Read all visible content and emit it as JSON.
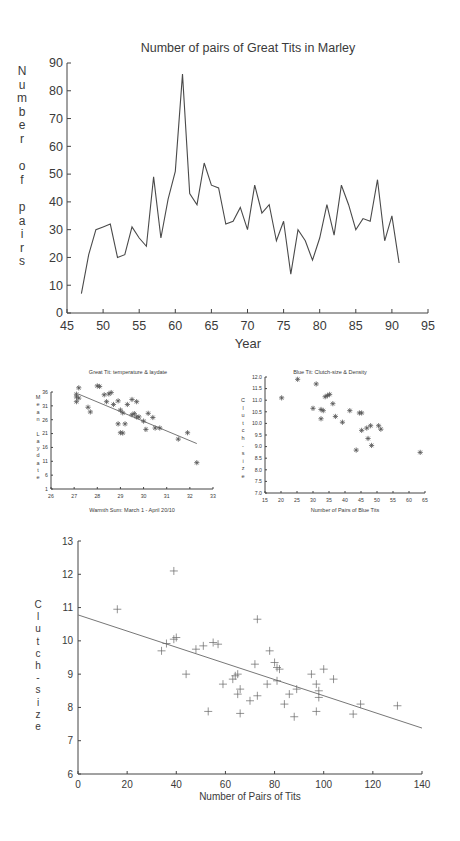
{
  "chart_data": [
    {
      "id": "great-tit-pairs",
      "type": "line",
      "title": "Number of pairs of Great Tits in Marley",
      "xlabel": "Year",
      "ylabel": "Number of pairs",
      "xlim": [
        45,
        95
      ],
      "ylim": [
        0,
        90
      ],
      "xticks": [
        45,
        50,
        55,
        60,
        65,
        70,
        75,
        80,
        85,
        90,
        95
      ],
      "yticks": [
        0,
        10,
        20,
        30,
        40,
        50,
        60,
        70,
        80,
        90
      ],
      "grid": false,
      "x": [
        47,
        48,
        49,
        50,
        51,
        52,
        53,
        54,
        55,
        56,
        57,
        58,
        59,
        60,
        61,
        62,
        63,
        64,
        65,
        66,
        67,
        68,
        69,
        70,
        71,
        72,
        73,
        74,
        75,
        76,
        77,
        78,
        79,
        80,
        81,
        82,
        83,
        84,
        85,
        86,
        87,
        88,
        89,
        90,
        91
      ],
      "y": [
        7,
        21,
        30,
        31,
        32,
        20,
        21,
        31,
        27,
        24,
        49,
        27,
        41,
        51,
        86,
        43,
        39,
        54,
        46,
        45,
        32,
        33,
        38,
        30,
        46,
        36,
        39,
        26,
        33,
        14,
        30,
        26,
        19,
        27,
        39,
        28,
        46,
        39,
        30,
        34,
        33,
        48,
        26,
        35,
        18
      ]
    },
    {
      "id": "great-tit-temperature-laydate",
      "type": "scatter",
      "title": "Great Tit: temperature & laydate",
      "xlabel": "Warmth Sum: March 1 - April 20/10",
      "ylabel": "Mean Laydate",
      "xlim": [
        26,
        33
      ],
      "ylim": [
        1,
        36
      ],
      "xticks": [
        26,
        27,
        28,
        29,
        30,
        31,
        32,
        33
      ],
      "yticks": [
        1,
        6,
        11,
        16,
        21,
        26,
        31,
        36
      ],
      "grid": false,
      "marker": "asterisk",
      "points": [
        [
          27.2,
          37.5
        ],
        [
          27.1,
          35.2
        ],
        [
          27.1,
          34.2
        ],
        [
          27.2,
          33.8
        ],
        [
          27.1,
          32.5
        ],
        [
          27.6,
          30.5
        ],
        [
          27.7,
          28.8
        ],
        [
          28.0,
          38.2
        ],
        [
          28.1,
          38.0
        ],
        [
          28.3,
          35.0
        ],
        [
          28.4,
          32.5
        ],
        [
          28.5,
          35.3
        ],
        [
          28.6,
          35.8
        ],
        [
          28.7,
          31.5
        ],
        [
          28.9,
          32.8
        ],
        [
          29.0,
          29.5
        ],
        [
          28.9,
          24.5
        ],
        [
          29.0,
          21.3
        ],
        [
          29.1,
          21.2
        ],
        [
          29.1,
          28.5
        ],
        [
          29.2,
          24.5
        ],
        [
          29.3,
          31.5
        ],
        [
          29.5,
          33.3
        ],
        [
          29.5,
          27.8
        ],
        [
          29.6,
          28.2
        ],
        [
          29.7,
          27.0
        ],
        [
          29.7,
          32.5
        ],
        [
          29.8,
          27.0
        ],
        [
          30.0,
          25.5
        ],
        [
          30.1,
          22.5
        ],
        [
          30.4,
          26.8
        ],
        [
          30.5,
          23.0
        ],
        [
          30.7,
          23.0
        ],
        [
          30.2,
          28.3
        ],
        [
          31.5,
          19.0
        ],
        [
          31.9,
          21.3
        ],
        [
          32.3,
          10.5
        ]
      ],
      "trendline": {
        "x": [
          27.2,
          32.3
        ],
        "y": [
          35.2,
          17.4
        ]
      }
    },
    {
      "id": "blue-tit-clutch-density",
      "type": "scatter",
      "title": "Blue Tit: Clutch-size & Density",
      "xlabel": "Number of Pairs of Blue Tits",
      "ylabel": "Clutch-size",
      "xlim": [
        15,
        65
      ],
      "ylim": [
        7.0,
        12.0
      ],
      "xticks": [
        15,
        20,
        25,
        30,
        35,
        40,
        45,
        50,
        55,
        60,
        65
      ],
      "yticks": [
        "7.0",
        "7.5",
        "8.0",
        "8.5",
        "9.0",
        "9.5",
        "10.0",
        "10.5",
        "11.0",
        "11.5",
        "12.0"
      ],
      "grid": false,
      "marker": "asterisk",
      "points": [
        [
          20.2,
          11.1
        ],
        [
          25.2,
          11.9
        ],
        [
          31.0,
          11.7
        ],
        [
          30.0,
          10.65
        ],
        [
          32.5,
          10.6
        ],
        [
          33.2,
          10.55
        ],
        [
          32.5,
          10.2
        ],
        [
          33.8,
          11.15
        ],
        [
          34.5,
          11.2
        ],
        [
          35.2,
          11.25
        ],
        [
          36.2,
          10.85
        ],
        [
          37.0,
          10.3
        ],
        [
          39.2,
          10.05
        ],
        [
          41.5,
          10.55
        ],
        [
          44.5,
          10.45
        ],
        [
          45.2,
          10.45
        ],
        [
          43.5,
          8.85
        ],
        [
          45.2,
          9.7
        ],
        [
          46.8,
          9.8
        ],
        [
          48.0,
          9.9
        ],
        [
          47.2,
          9.35
        ],
        [
          48.3,
          9.05
        ],
        [
          50.5,
          9.9
        ],
        [
          51.2,
          9.75
        ],
        [
          63.5,
          8.75
        ]
      ]
    },
    {
      "id": "tits-clutch-density",
      "type": "scatter",
      "title": "",
      "xlabel": "Number of Pairs of Tits",
      "ylabel": "Clutch-size",
      "xlim": [
        0,
        140
      ],
      "ylim": [
        6,
        13
      ],
      "xticks": [
        0,
        20,
        40,
        60,
        80,
        100,
        120,
        140
      ],
      "yticks": [
        6,
        7,
        8,
        9,
        10,
        11,
        12,
        13
      ],
      "grid": false,
      "marker": "plus",
      "points": [
        [
          16,
          10.95
        ],
        [
          34,
          9.7
        ],
        [
          36,
          9.92
        ],
        [
          39,
          10.05
        ],
        [
          39,
          12.1
        ],
        [
          40,
          10.1
        ],
        [
          44,
          9.0
        ],
        [
          48,
          9.75
        ],
        [
          51,
          9.85
        ],
        [
          53,
          7.88
        ],
        [
          55,
          9.95
        ],
        [
          57,
          9.9
        ],
        [
          59,
          8.7
        ],
        [
          63,
          8.85
        ],
        [
          64,
          8.95
        ],
        [
          65,
          9.0
        ],
        [
          65,
          8.4
        ],
        [
          66,
          8.55
        ],
        [
          66,
          7.82
        ],
        [
          70,
          8.2
        ],
        [
          72,
          9.3
        ],
        [
          73,
          8.35
        ],
        [
          73,
          10.65
        ],
        [
          77,
          8.7
        ],
        [
          78,
          9.7
        ],
        [
          80,
          9.35
        ],
        [
          81,
          9.2
        ],
        [
          81,
          8.8
        ],
        [
          82,
          9.15
        ],
        [
          84,
          8.1
        ],
        [
          86,
          8.4
        ],
        [
          88,
          7.72
        ],
        [
          89,
          8.55
        ],
        [
          95,
          9.0
        ],
        [
          97,
          7.88
        ],
        [
          97,
          8.7
        ],
        [
          98,
          8.3
        ],
        [
          98,
          8.5
        ],
        [
          100,
          9.15
        ],
        [
          104,
          8.85
        ],
        [
          112,
          7.8
        ],
        [
          115,
          8.1
        ],
        [
          130,
          8.05
        ]
      ],
      "trendline": {
        "x": [
          0,
          140
        ],
        "y": [
          10.78,
          7.38
        ]
      }
    }
  ],
  "labels": {
    "chart1_title": "Number of pairs of Great Tits in Marley",
    "chart1_xlabel": "Year",
    "chart1_ylabel_letters": [
      "N",
      "u",
      "m",
      "b",
      "e",
      "r",
      "",
      "o",
      "f",
      "",
      "p",
      "a",
      "i",
      "r",
      "s"
    ],
    "chart2_title": "Great Tit: temperature & laydate",
    "chart2_xlabel": "Warmth Sum: March 1 - April 20/10",
    "chart2_ylabel_letters": [
      "M",
      "e",
      "a",
      "n",
      "",
      "L",
      "a",
      "y",
      "d",
      "a",
      "t",
      "e"
    ],
    "chart3_title": "Blue Tit: Clutch-size & Density",
    "chart3_xlabel": "Number of Pairs of Blue Tits",
    "chart3_ylabel_letters": [
      "C",
      "l",
      "u",
      "t",
      "c",
      "h",
      "-",
      "s",
      "i",
      "z",
      "e"
    ],
    "chart4_xlabel": "Number of Pairs of Tits",
    "chart4_ylabel_letters": [
      "C",
      "l",
      "u",
      "t",
      "c",
      "h",
      "-",
      "s",
      "i",
      "z",
      "e"
    ]
  }
}
